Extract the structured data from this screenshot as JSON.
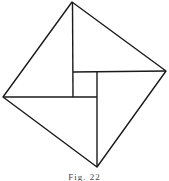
{
  "figure": {
    "caption": "Fig. 22",
    "stroke_color": "#1a1a1a",
    "outer_square": {
      "vertices": [
        [
          72,
          2
        ],
        [
          166,
          71
        ],
        [
          97,
          167
        ],
        [
          3,
          97
        ]
      ]
    },
    "inner_square": {
      "x": 73,
      "y": 72,
      "size": 24
    },
    "segments": [
      [
        [
          72,
          2
        ],
        [
          73,
          97
        ]
      ],
      [
        [
          73,
          72
        ],
        [
          166,
          71
        ]
      ],
      [
        [
          97,
          72
        ],
        [
          97,
          167
        ]
      ],
      [
        [
          3,
          97
        ],
        [
          97,
          97
        ]
      ]
    ]
  }
}
